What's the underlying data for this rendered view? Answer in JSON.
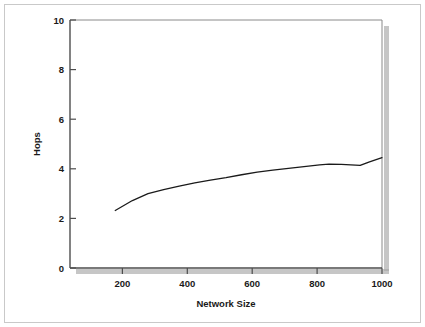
{
  "figure": {
    "background_color": "#ffffff",
    "frame_color": "#c9c9c9",
    "axis_color": "#4d4d4d",
    "line_color": "#1a1a1a",
    "shadow_color": "#9a9a9a"
  },
  "chart_data": {
    "type": "line",
    "title": "",
    "subtitle": "",
    "xlabel": "Network Size",
    "ylabel": "Hops",
    "xlim": [
      0,
      1000
    ],
    "ylim": [
      0,
      10
    ],
    "xticks": [
      200,
      400,
      600,
      800,
      1000
    ],
    "xtick_labels": [
      "200",
      "400",
      "600",
      "800",
      "1000"
    ],
    "yticks": [
      0,
      2,
      4,
      6,
      8,
      10
    ],
    "ytick_labels": [
      "0",
      "2",
      "4",
      "6",
      "8",
      "10"
    ],
    "grid": false,
    "legend": null,
    "legend_position": "none",
    "annotations": [],
    "series": [
      {
        "name": "Hops vs Network Size",
        "color": "#1a1a1a",
        "line_width": 1.3,
        "marker": "none",
        "x": [
          145,
          200,
          250,
          300,
          350,
          400,
          450,
          500,
          550,
          600,
          650,
          700,
          750,
          800,
          830,
          870,
          900,
          930,
          960,
          1000
        ],
        "y": [
          2.32,
          2.72,
          3.0,
          3.16,
          3.3,
          3.43,
          3.54,
          3.64,
          3.76,
          3.87,
          3.95,
          4.02,
          4.09,
          4.16,
          4.19,
          4.18,
          4.16,
          4.14,
          4.28,
          4.45
        ]
      }
    ]
  },
  "labels": {
    "x_axis_title": "Network Size",
    "y_axis_title": "Hops"
  }
}
